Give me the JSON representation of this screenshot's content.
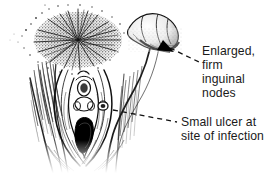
{
  "figure": {
    "type": "medical-illustration",
    "background_color": "#ffffff",
    "ink_color": "#111111",
    "text_color": "#1a1a1a"
  },
  "callouts": [
    {
      "id": "nodes",
      "text": "Enlarged,\nfirm\ninguinal\nnodes",
      "lines": [
        "Enlarged,",
        "firm",
        "inguinal",
        "nodes"
      ],
      "leader": "dashed",
      "pointer": "arrowhead"
    },
    {
      "id": "ulcer",
      "text": "Small ulcer at\nsite of infection",
      "lines": [
        "Small ulcer at",
        "site of infection"
      ],
      "leader": "dashed",
      "pointer": "none"
    }
  ]
}
